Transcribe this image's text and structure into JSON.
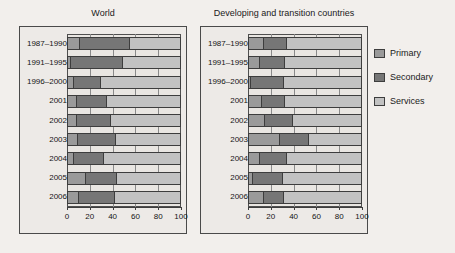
{
  "chart_data": {
    "type": "bar",
    "orientation": "horizontal",
    "stacked": true,
    "title": "",
    "xlabel": "",
    "ylabel": "",
    "xlim": [
      0,
      100
    ],
    "xticks": [
      0,
      20,
      40,
      60,
      80,
      100
    ],
    "xticklabels": [
      "0",
      "20",
      "40",
      "60",
      "80",
      "100"
    ],
    "grid": true,
    "legend_position": "right",
    "legend": [
      "Primary",
      "Secondary",
      "Services"
    ],
    "colors": {
      "primary": "#9a9a9a",
      "secondary": "#767676",
      "services": "#c2c2c2",
      "panel_background": "#edeae7",
      "page_background": "#f2efec",
      "axis": "#3d3d3d"
    },
    "categories": [
      "1987–1990",
      "1991–1995",
      "1996–2000",
      "2001",
      "2002",
      "2003",
      "2004",
      "2005",
      "2006"
    ],
    "panels": [
      {
        "name": "World",
        "title": "World",
        "series": [
          {
            "name": "Primary",
            "values": [
              11,
              3,
              5,
              8,
              8,
              9,
              5,
              16,
              10
            ]
          },
          {
            "name": "Secondary",
            "values": [
              44,
              46,
              24,
              27,
              30,
              34,
              27,
              28,
              32
            ]
          },
          {
            "name": "Services",
            "values": [
              45,
              51,
              71,
              65,
              62,
              57,
              68,
              56,
              58
            ]
          }
        ]
      },
      {
        "name": "Developing and transition countries",
        "title": "Developing and transition countries",
        "series": [
          {
            "name": "Primary",
            "values": [
              13,
              10,
              2,
              12,
              14,
              28,
              10,
              4,
              13
            ]
          },
          {
            "name": "Secondary",
            "values": [
              21,
              22,
              29,
              20,
              25,
              26,
              24,
              26,
              18
            ]
          },
          {
            "name": "Services",
            "values": [
              66,
              68,
              69,
              68,
              61,
              46,
              66,
              70,
              69
            ]
          }
        ]
      }
    ]
  }
}
